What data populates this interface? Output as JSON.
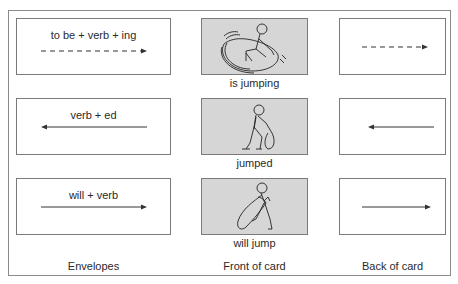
{
  "diagram": {
    "columns": [
      {
        "label": "Envelopes"
      },
      {
        "label": "Front of card"
      },
      {
        "label": "Back of card"
      }
    ],
    "rows": [
      {
        "envelope_text": "to be + verb + ing",
        "arrow": "dashed-right",
        "front_caption": "is jumping",
        "figure": "stick-figure-mid-jump"
      },
      {
        "envelope_text": "verb + ed",
        "arrow": "solid-left",
        "front_caption": "jumped",
        "figure": "stick-figure-landed"
      },
      {
        "envelope_text": "will + verb",
        "arrow": "solid-right",
        "front_caption": "will jump",
        "figure": "stick-figure-crouching"
      }
    ],
    "colors": {
      "card_fill": "#d6d6d6",
      "border": "#7a7a7a",
      "text": "#2a2a2a"
    }
  }
}
